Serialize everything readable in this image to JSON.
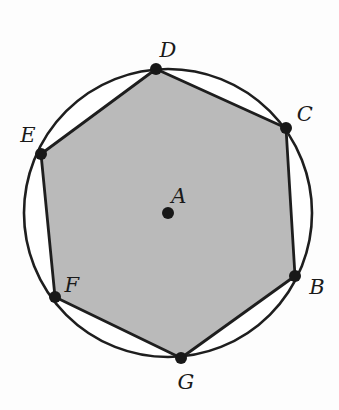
{
  "figure": {
    "kind": "inscribed-regular-hexagon-in-circle",
    "background_color": "#fdfdfd",
    "stroke_color": "#1a1a1a",
    "hexagon_fill_color": "#b9b9b9",
    "circle_fill_color": "#ffffff",
    "stroke_width": 2.6,
    "vertex_dot_radius": 6
  },
  "circle": {
    "center_label": "A",
    "cx": 168,
    "cy": 213,
    "r": 144
  },
  "center_point": {
    "label": "A",
    "x": 168,
    "y": 213,
    "label_x": 179,
    "label_y": 196
  },
  "vertices": [
    {
      "label": "B",
      "x": 295,
      "y": 276,
      "label_x": 317,
      "label_y": 287
    },
    {
      "label": "C",
      "x": 286,
      "y": 128,
      "label_x": 305,
      "label_y": 114
    },
    {
      "label": "D",
      "x": 156,
      "y": 69,
      "label_x": 168,
      "label_y": 50
    },
    {
      "label": "E",
      "x": 41,
      "y": 154,
      "label_x": 28,
      "label_y": 135
    },
    {
      "label": "F",
      "x": 55,
      "y": 297,
      "label_x": 72,
      "label_y": 285
    },
    {
      "label": "G",
      "x": 181,
      "y": 358,
      "label_x": 186,
      "label_y": 382
    }
  ],
  "polygon_points": "295,276 286,128 156,69 41,154 55,297 181,358"
}
